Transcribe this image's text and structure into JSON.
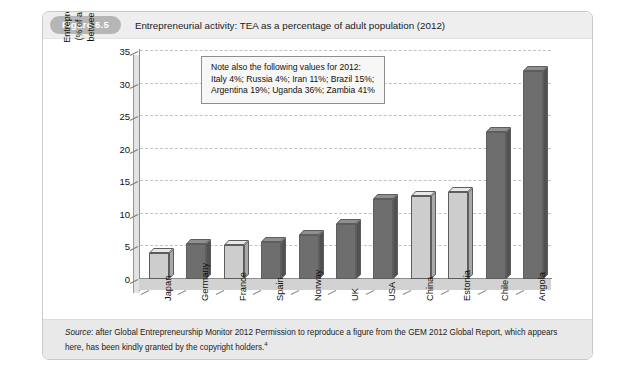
{
  "running_head": "",
  "figure": {
    "badge": "Figure 6.5",
    "title": "Entrepreneurial activity: TEA as a percentage of adult population (2012)"
  },
  "annotation": {
    "line1": "Note also the following values for 2012:",
    "line2": "Italy 4%; Russia 4%; Iran 11%; Brazil 15%;",
    "line3": "Argentina 19%; Uganda 36%; Zambia 41%"
  },
  "axis_title": {
    "line1": "Entrepreneurial activity",
    "line2": "(% of adult population",
    "line3": "between 18–64 years)"
  },
  "source": {
    "label": "Source",
    "text": ": after Global Entrepreneurship Monitor 2012 Permission to reproduce a figure from the GEM 2012 Global Report, which appears here, has been kindly granted by the copyright holders.",
    "marker": "4"
  },
  "chart_data": {
    "type": "bar",
    "title": "Entrepreneurial activity: TEA as a percentage of adult population (2012)",
    "xlabel": "",
    "ylabel": "Entrepreneurial activity (% of adult population between 18–64 years)",
    "ylim": [
      0,
      35
    ],
    "yticks": [
      0,
      5,
      10,
      15,
      20,
      25,
      30,
      35
    ],
    "grid": true,
    "legend": "none",
    "categories": [
      "Japan",
      "Germany",
      "France",
      "Spain",
      "Norway",
      "UK",
      "USA",
      "China",
      "Estonia",
      "Chile",
      "Angola"
    ],
    "values": [
      4,
      5.3,
      5.2,
      5.7,
      6.8,
      8.5,
      12.3,
      12.8,
      13.3,
      22.5,
      32
    ],
    "bar_shades": [
      "light",
      "dark",
      "light",
      "dark",
      "dark",
      "dark",
      "dark",
      "light",
      "light",
      "dark",
      "dark"
    ],
    "colors": {
      "light_fill": "#cdcdcd",
      "dark_fill": "#6e6e6e",
      "gridline": "#c2c2c2",
      "axis": "#8d8d8d",
      "badge": "#b6b6b6",
      "title_bar": "#eeeeee",
      "source_bar": "#e9e9e9"
    },
    "extra_values_note": {
      "Italy": 4,
      "Russia": 4,
      "Iran": 11,
      "Brazil": 15,
      "Argentina": 19,
      "Uganda": 36,
      "Zambia": 41
    }
  }
}
